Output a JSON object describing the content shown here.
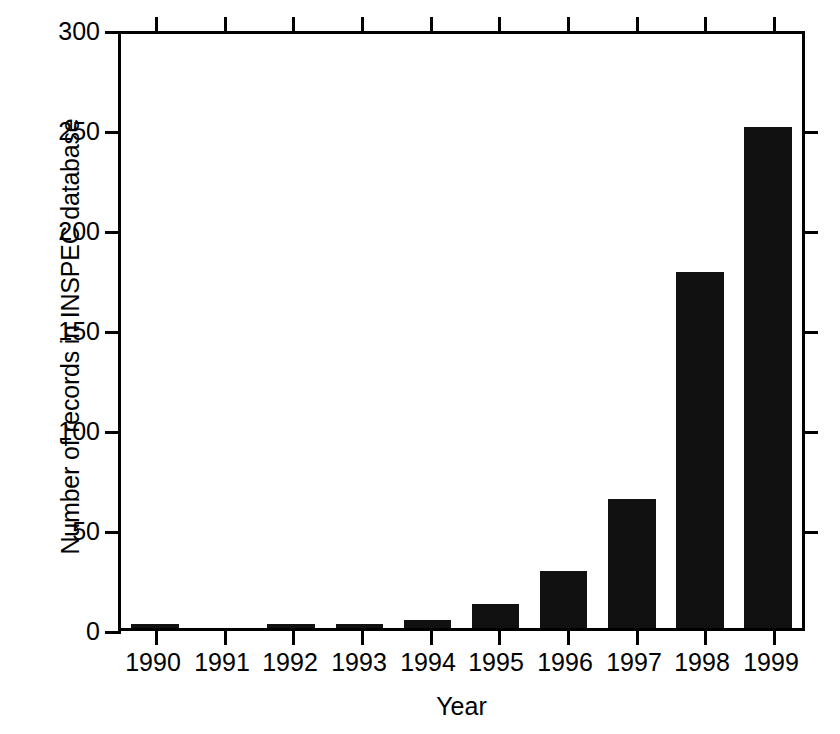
{
  "chart_data": {
    "type": "bar",
    "title": "",
    "xlabel": "Year",
    "ylabel": "Number of records in INSPEC database",
    "categories": [
      "1990",
      "1991",
      "1992",
      "1993",
      "1994",
      "1995",
      "1996",
      "1997",
      "1998",
      "1999"
    ],
    "values": [
      1,
      0,
      2,
      1,
      4,
      12,
      29,
      65,
      180,
      253
    ],
    "ylim": [
      0,
      300
    ],
    "yticks": [
      "0",
      "50",
      "100",
      "150",
      "200",
      "250",
      "300"
    ],
    "ytick_values": [
      0,
      50,
      100,
      150,
      200,
      250,
      300
    ],
    "grid": false,
    "legend": "none",
    "bar_color": "#111111",
    "axis_color": "#000000",
    "background": "#ffffff"
  }
}
